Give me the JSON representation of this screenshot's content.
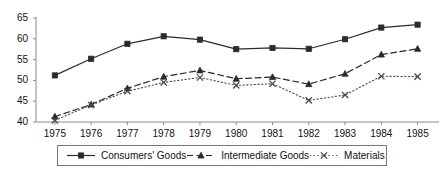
{
  "chart_data": {
    "type": "line",
    "title": "",
    "xlabel": "",
    "ylabel": "",
    "ylim": [
      40,
      65
    ],
    "yticks": [
      40,
      45,
      50,
      55,
      60,
      65
    ],
    "grid": false,
    "legend_position": "bottom",
    "categories": [
      "1975",
      "1976",
      "1977",
      "1978",
      "1979",
      "1980",
      "1981",
      "1982",
      "1983",
      "1984",
      "1985"
    ],
    "series": [
      {
        "name": "Consumers' Goods",
        "marker": "square",
        "linestyle": "solid",
        "color": "#2b2b2b",
        "values": [
          51.2,
          55.2,
          58.8,
          60.6,
          59.8,
          57.5,
          57.8,
          57.6,
          59.9,
          62.7,
          63.4
        ]
      },
      {
        "name": "Intermediate Goods",
        "marker": "triangle",
        "linestyle": "dashed",
        "color": "#2b2b2b",
        "values": [
          41.3,
          44.2,
          48.1,
          50.9,
          52.4,
          50.4,
          50.8,
          49.1,
          51.6,
          56.2,
          57.6
        ]
      },
      {
        "name": "Materials",
        "marker": "cross",
        "linestyle": "dotted",
        "color": "#4a4a4a",
        "values": [
          40.4,
          44.1,
          47.4,
          49.5,
          50.7,
          48.8,
          49.2,
          45.2,
          46.5,
          51.0,
          50.9
        ]
      }
    ]
  },
  "axis": {
    "y_tick_labels": [
      "65",
      "60",
      "55",
      "50",
      "45",
      "40"
    ],
    "x_tick_labels": [
      "1975",
      "1976",
      "1977",
      "1978",
      "1979",
      "1980",
      "1981",
      "1982",
      "1983",
      "1984",
      "1985"
    ]
  },
  "legend": {
    "items": [
      {
        "label": "Consumers' Goods"
      },
      {
        "label": "Intermediate Goods"
      },
      {
        "label": "Materials"
      }
    ]
  }
}
